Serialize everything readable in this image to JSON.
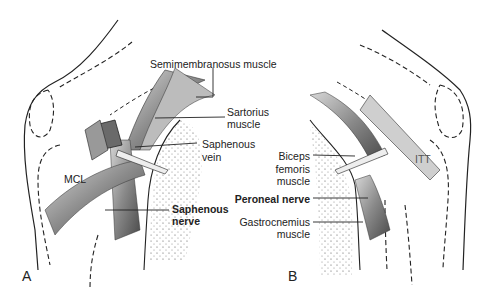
{
  "figure": {
    "panels": [
      {
        "letter": "A",
        "labels": {
          "semimembranosus": "Semimembranosus muscle",
          "sartorius_1": "Sartorius",
          "sartorius_2": "muscle",
          "saphenous_vein_1": "Saphenous",
          "saphenous_vein_2": "vein",
          "mcl": "MCL",
          "saphenous_nerve_1": "Saphenous",
          "saphenous_nerve_2": "nerve"
        }
      },
      {
        "letter": "B",
        "labels": {
          "biceps_1": "Biceps",
          "biceps_2": "femoris",
          "biceps_3": "muscle",
          "itt": "ITT",
          "peroneal": "Peroneal nerve",
          "gastroc_1": "Gastrocnemius",
          "gastroc_2": "muscle"
        }
      }
    ]
  }
}
